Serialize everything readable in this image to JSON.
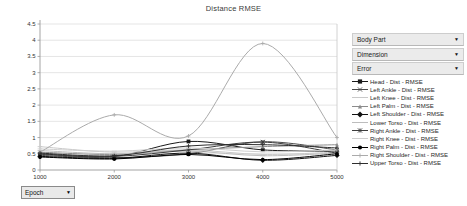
{
  "chart_data": {
    "type": "line",
    "title": "Distance RMSE",
    "xlabel": "Epoch",
    "ylabel": "",
    "x": [
      1000,
      2000,
      3000,
      4000,
      5000
    ],
    "x_ticks": [
      "1000",
      "2000",
      "3000",
      "4000",
      "5000"
    ],
    "y_ticks": [
      "0",
      "0.5",
      "1",
      "1.5",
      "2",
      "2.5",
      "3",
      "3.5",
      "4",
      "4.5"
    ],
    "xlim": [
      1000,
      5000
    ],
    "ylim": [
      0,
      4.5
    ],
    "grid": "horizontal",
    "legend_position": "right",
    "grid_color": "#dedede",
    "axis_color": "#9a9a9a",
    "series": [
      {
        "name": "Head - Dist - RMSE",
        "marker": "square",
        "color": "#1a1a1a",
        "values": [
          0.5,
          0.42,
          0.88,
          0.62,
          0.58
        ]
      },
      {
        "name": "Left Ankle - Dist - RMSE",
        "marker": "x",
        "color": "#4a4a4a",
        "values": [
          0.45,
          0.38,
          0.5,
          0.87,
          0.62
        ]
      },
      {
        "name": "Left Knee - Dist - RMSE",
        "marker": "dash",
        "color": "#c9c9c9",
        "values": [
          0.72,
          0.55,
          0.62,
          0.48,
          0.55
        ]
      },
      {
        "name": "Left Palm - Dist - RMSE",
        "marker": "triangle",
        "color": "#8c8c8c",
        "values": [
          0.55,
          0.48,
          0.62,
          0.72,
          0.78
        ]
      },
      {
        "name": "Left Shoulder - Dist - RMSE",
        "marker": "diamond",
        "color": "#111111",
        "values": [
          0.42,
          0.36,
          0.52,
          0.3,
          0.45
        ]
      },
      {
        "name": "Lower Torso - Dist - RMSE",
        "marker": "dash",
        "color": "#bdbdbd",
        "values": [
          0.6,
          0.5,
          0.58,
          0.44,
          0.52
        ]
      },
      {
        "name": "Right Ankle - Dist - RMSE",
        "marker": "asterisk",
        "color": "#3d3d3d",
        "values": [
          0.48,
          0.42,
          0.62,
          0.86,
          0.52
        ]
      },
      {
        "name": "Right Knee - Dist - RMSE",
        "marker": "dash",
        "color": "#cfcfcf",
        "values": [
          0.65,
          0.58,
          0.68,
          0.56,
          0.62
        ]
      },
      {
        "name": "Right Palm - Dist - RMSE",
        "marker": "circle",
        "color": "#000000",
        "values": [
          0.4,
          0.34,
          0.48,
          0.32,
          0.5
        ]
      },
      {
        "name": "Right Shoulder - Dist - RMSE",
        "marker": "plus",
        "color": "#ababab",
        "values": [
          0.55,
          1.7,
          1.05,
          3.9,
          1.0
        ]
      },
      {
        "name": "Upper Torso - Dist - RMSE",
        "marker": "plus",
        "color": "#2e2e2e",
        "values": [
          0.52,
          0.44,
          0.74,
          0.78,
          0.68
        ]
      }
    ]
  },
  "controls": {
    "body_part_label": "Body Part",
    "dimension_label": "Dimension",
    "error_label": "Error",
    "epoch_label": "Epoch",
    "dropdown_arrow": "▼"
  }
}
